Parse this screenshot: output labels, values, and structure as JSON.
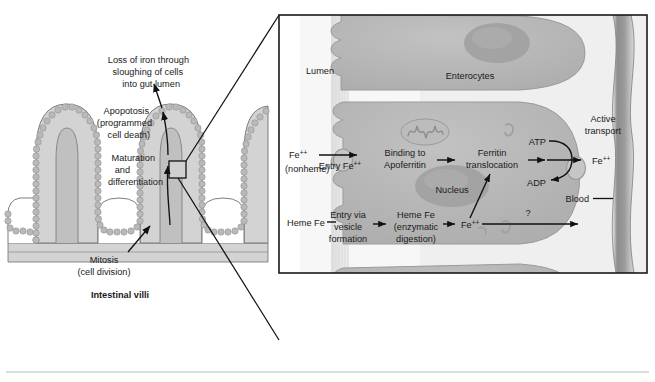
{
  "figure": {
    "colors": {
      "tissue_fill": "#c9c9c9",
      "tissue_fill_light": "#dcdcdc",
      "tissue_stroke": "#6e6e6e",
      "cell_fill": "#b4b4b4",
      "cell_stroke": "#8f8f8f",
      "nucleus_fill": "#a2a2a2",
      "vessel_fill": "#8f8f8f",
      "panel_stroke": "#1a1a1a",
      "text": "#1a1a1a",
      "background": "#ffffff"
    }
  },
  "left_panel": {
    "caption": "Intestinal villi",
    "annotations": [
      {
        "id": "loss",
        "lines": [
          "Loss of iron through",
          "sloughing of cells",
          "into gut lumen"
        ]
      },
      {
        "id": "apoptosis",
        "lines": [
          "Apopotosis",
          "(programmed",
          "cell death)"
        ]
      },
      {
        "id": "maturation",
        "lines": [
          "Maturation",
          "and",
          "differentiation"
        ]
      },
      {
        "id": "mitosis",
        "lines": [
          "Mitosis",
          "(cell division)"
        ]
      }
    ]
  },
  "right_panel": {
    "region_labels": [
      {
        "id": "lumen",
        "text": "Lumen"
      },
      {
        "id": "enterocytes",
        "text": "Enterocytes"
      },
      {
        "id": "nucleus",
        "text": "Nucleus"
      },
      {
        "id": "blood",
        "text": "Blood"
      }
    ],
    "active_transport": {
      "line1": "Active",
      "line2": "transport"
    },
    "energy": {
      "atp": "ATP",
      "adp": "ADP"
    },
    "nonheme_pathway": {
      "source": {
        "line1": "Fe",
        "sup1": "++",
        "line2": "(nonheme)"
      },
      "steps": [
        {
          "id": "entry",
          "lines": [
            "Entry Fe"
          ],
          "sup": "++"
        },
        {
          "id": "binding",
          "lines": [
            "Binding to",
            "Apoferritin"
          ]
        },
        {
          "id": "ferritin",
          "lines": [
            "Ferritin",
            "translocation"
          ]
        }
      ],
      "output": {
        "text": "Fe",
        "sup": "++"
      }
    },
    "heme_pathway": {
      "source": {
        "text": "Heme Fe"
      },
      "steps": [
        {
          "id": "vesicle",
          "lines": [
            "Entry via",
            "vesicle",
            "formation"
          ]
        },
        {
          "id": "digestion",
          "lines": [
            "Heme Fe",
            "(enzymatic",
            "digestion)"
          ]
        }
      ],
      "product": {
        "text": "Fe",
        "sup": "++"
      },
      "unknown_marker": "?"
    }
  }
}
